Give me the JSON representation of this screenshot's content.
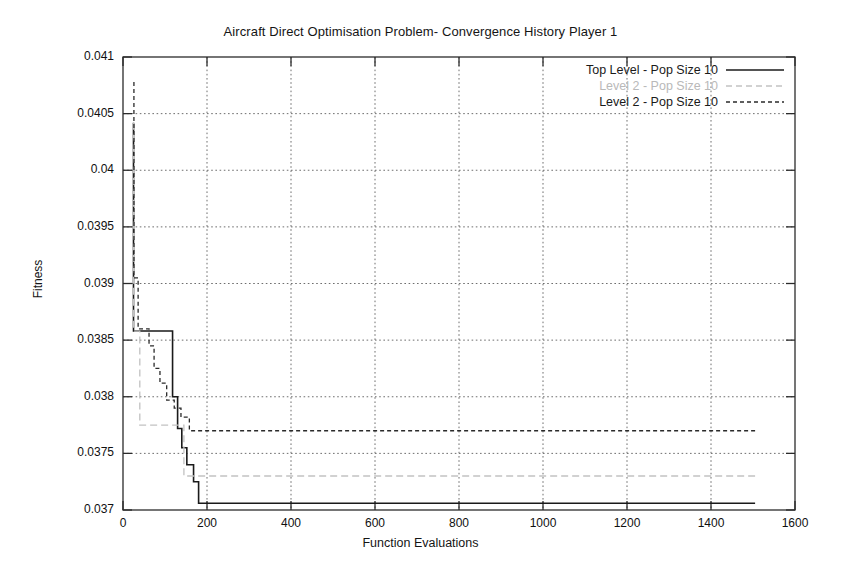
{
  "chart_data": {
    "type": "line",
    "title": "Aircraft Direct Optimisation Problem- Convergence History Player 1",
    "xlabel": "Function Evaluations",
    "ylabel": "Fitness",
    "xlim": [
      0,
      1600
    ],
    "ylim": [
      0.037,
      0.041
    ],
    "xticks": [
      0,
      200,
      400,
      600,
      800,
      1000,
      1200,
      1400,
      1600
    ],
    "yticks": [
      0.037,
      0.0375,
      0.038,
      0.0385,
      0.039,
      0.0395,
      0.04,
      0.0405,
      0.041
    ],
    "xtick_labels": [
      "0",
      "200",
      "400",
      "600",
      "800",
      "1000",
      "1200",
      "1400",
      "1600"
    ],
    "ytick_labels": [
      "0.037",
      "0.0375",
      "0.038",
      "0.0385",
      "0.039",
      "0.0395",
      "0.04",
      "0.0405",
      "0.041"
    ],
    "grid": true,
    "legend_position": "top-right",
    "series": [
      {
        "name": "Top Level - Pop Size 10",
        "style": "solid",
        "color": "#1a1a1a",
        "points": [
          [
            25,
            0.04042
          ],
          [
            25,
            0.03858
          ],
          [
            28,
            0.03858
          ],
          [
            90,
            0.03858
          ],
          [
            118,
            0.03858
          ],
          [
            118,
            0.038
          ],
          [
            130,
            0.038
          ],
          [
            130,
            0.03772
          ],
          [
            140,
            0.03772
          ],
          [
            140,
            0.03755
          ],
          [
            152,
            0.03755
          ],
          [
            152,
            0.0374
          ],
          [
            168,
            0.0374
          ],
          [
            168,
            0.03725
          ],
          [
            180,
            0.03725
          ],
          [
            180,
            0.03706
          ],
          [
            1505,
            0.03706
          ]
        ]
      },
      {
        "name": "Level 2 - Pop Size 10",
        "style": "dashed",
        "color": "#c2c2c2",
        "points": [
          [
            25,
            0.04042
          ],
          [
            25,
            0.03858
          ],
          [
            40,
            0.03858
          ],
          [
            40,
            0.03775
          ],
          [
            145,
            0.03775
          ],
          [
            145,
            0.0373
          ],
          [
            1505,
            0.0373
          ]
        ]
      },
      {
        "name": "Level 2 - Pop Size 10",
        "style": "dotted",
        "color": "#2a2a2a",
        "points": [
          [
            26,
            0.04078
          ],
          [
            26,
            0.03905
          ],
          [
            36,
            0.03905
          ],
          [
            36,
            0.0386
          ],
          [
            62,
            0.0386
          ],
          [
            62,
            0.03845
          ],
          [
            74,
            0.03845
          ],
          [
            74,
            0.03825
          ],
          [
            88,
            0.03825
          ],
          [
            88,
            0.03812
          ],
          [
            104,
            0.03812
          ],
          [
            104,
            0.03797
          ],
          [
            122,
            0.03797
          ],
          [
            122,
            0.0379
          ],
          [
            138,
            0.0379
          ],
          [
            138,
            0.03782
          ],
          [
            158,
            0.03782
          ],
          [
            158,
            0.0377
          ],
          [
            1505,
            0.0377
          ]
        ]
      }
    ]
  },
  "legend": {
    "entries": [
      {
        "label": "Top Level - Pop Size 10"
      },
      {
        "label": "Level 2 - Pop Size 10"
      },
      {
        "label": "Level 2 - Pop Size 10"
      }
    ]
  }
}
